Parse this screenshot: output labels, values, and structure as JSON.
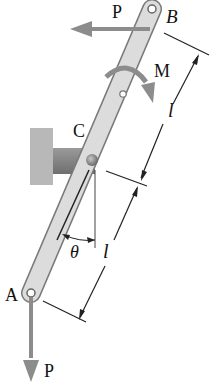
{
  "figure": {
    "type": "mechanics free-body diagram",
    "labels": {
      "point_a": "A",
      "point_b": "B",
      "point_c": "C",
      "force_top": "P",
      "force_bottom": "P",
      "moment": "M",
      "angle": "θ",
      "length_upper": "l",
      "length_lower": "l"
    },
    "colors": {
      "bar_fill": "#d9d9d9",
      "bar_stroke": "#7a7a7a",
      "arrow": "#8c8c8c",
      "wall": "#b8b8b8",
      "bracket": "#8a8a8a",
      "dimension_line": "#222222"
    }
  }
}
